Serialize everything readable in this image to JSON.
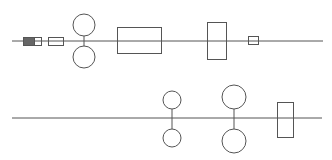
{
  "diagram": {
    "type": "shaft-schematic",
    "background": "#ffffff",
    "stroke_color": "#555555",
    "fill_dark": "#666666",
    "width": 332,
    "height": 160,
    "shafts": [
      {
        "id": "upper-shaft",
        "line": {
          "x1": 12,
          "y1": 41,
          "x2": 323,
          "y2": 41
        },
        "elements": [
          {
            "kind": "coupling-filled",
            "x": 23,
            "y": 37,
            "w": 11,
            "h": 8
          },
          {
            "kind": "coupling-box",
            "x": 34,
            "y": 37,
            "w": 7,
            "h": 8
          },
          {
            "kind": "bearing-box",
            "x": 48,
            "y": 37,
            "w": 15,
            "h": 8
          },
          {
            "kind": "gear-pair",
            "cx": 84,
            "cy_top": 25,
            "cy_bottom": 57,
            "r": 11
          },
          {
            "kind": "wide-block",
            "x": 117,
            "y": 27,
            "w": 44,
            "h": 26
          },
          {
            "kind": "tall-block",
            "x": 207,
            "y": 22,
            "w": 19,
            "h": 37
          },
          {
            "kind": "small-box",
            "x": 248,
            "y": 36,
            "w": 10,
            "h": 8
          }
        ]
      },
      {
        "id": "lower-shaft",
        "line": {
          "x1": 12,
          "y1": 118,
          "x2": 322,
          "y2": 118
        },
        "elements": [
          {
            "kind": "gear-pair",
            "cx": 172,
            "cy_top": 100,
            "cy_bottom": 138,
            "r": 9
          },
          {
            "kind": "gear-pair",
            "cx": 234,
            "cy_top": 97,
            "cy_bottom": 141,
            "r": 12
          },
          {
            "kind": "tall-block",
            "x": 277,
            "y": 102,
            "w": 16,
            "h": 35
          }
        ]
      }
    ]
  }
}
